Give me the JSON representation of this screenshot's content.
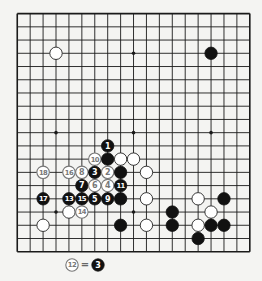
{
  "diagram": {
    "type": "go-board",
    "size": 19,
    "origin_px": {
      "x": 17.25,
      "y": 13.6
    },
    "spacing_px": {
      "x": 12.92,
      "y": 13.23
    },
    "stone_radius": 6.2,
    "colors": {
      "background": "#f4f4f2",
      "line": "#1a1a1a",
      "black_stone": "#111111",
      "white_stone": "#ffffff",
      "white_stone_border": "#222222",
      "numbered_white_ink": "#777777",
      "black_number_ink": "#ffffff"
    },
    "star_points": [
      [
        3,
        3
      ],
      [
        9,
        3
      ],
      [
        15,
        3
      ],
      [
        3,
        9
      ],
      [
        9,
        9
      ],
      [
        15,
        9
      ],
      [
        3,
        15
      ],
      [
        9,
        15
      ],
      [
        15,
        15
      ]
    ],
    "stones": [
      {
        "color": "white",
        "col": 3,
        "row": 3
      },
      {
        "color": "black",
        "col": 15,
        "row": 3
      },
      {
        "color": "black",
        "col": 7,
        "row": 10,
        "label": "1"
      },
      {
        "color": "white",
        "col": 6,
        "row": 11,
        "label": "10"
      },
      {
        "color": "black",
        "col": 7,
        "row": 11
      },
      {
        "color": "white",
        "col": 8,
        "row": 11
      },
      {
        "color": "white",
        "col": 9,
        "row": 11
      },
      {
        "color": "white",
        "col": 2,
        "row": 12,
        "label": "18"
      },
      {
        "color": "white",
        "col": 4,
        "row": 12,
        "label": "16"
      },
      {
        "color": "white",
        "col": 5,
        "row": 12,
        "label": "8"
      },
      {
        "color": "black",
        "col": 6,
        "row": 12,
        "label": "3"
      },
      {
        "color": "white",
        "col": 7,
        "row": 12,
        "label": "2"
      },
      {
        "color": "black",
        "col": 8,
        "row": 12
      },
      {
        "color": "white",
        "col": 10,
        "row": 12
      },
      {
        "color": "black",
        "col": 5,
        "row": 13,
        "label": "7"
      },
      {
        "color": "white",
        "col": 6,
        "row": 13,
        "label": "6"
      },
      {
        "color": "white",
        "col": 7,
        "row": 13,
        "label": "4"
      },
      {
        "color": "black",
        "col": 8,
        "row": 13,
        "label": "11"
      },
      {
        "color": "black",
        "col": 2,
        "row": 14,
        "label": "17"
      },
      {
        "color": "black",
        "col": 4,
        "row": 14,
        "label": "13"
      },
      {
        "color": "black",
        "col": 5,
        "row": 14,
        "label": "15"
      },
      {
        "color": "black",
        "col": 6,
        "row": 14,
        "label": "5"
      },
      {
        "color": "black",
        "col": 7,
        "row": 14,
        "label": "9"
      },
      {
        "color": "black",
        "col": 8,
        "row": 14
      },
      {
        "color": "white",
        "col": 10,
        "row": 14
      },
      {
        "color": "white",
        "col": 14,
        "row": 14
      },
      {
        "color": "black",
        "col": 16,
        "row": 14
      },
      {
        "color": "white",
        "col": 4,
        "row": 15
      },
      {
        "color": "white",
        "col": 5,
        "row": 15,
        "label": "14"
      },
      {
        "color": "black",
        "col": 12,
        "row": 15
      },
      {
        "color": "white",
        "col": 15,
        "row": 15
      },
      {
        "color": "white",
        "col": 2,
        "row": 16
      },
      {
        "color": "black",
        "col": 8,
        "row": 16
      },
      {
        "color": "white",
        "col": 10,
        "row": 16
      },
      {
        "color": "black",
        "col": 12,
        "row": 16
      },
      {
        "color": "white",
        "col": 14,
        "row": 16
      },
      {
        "color": "black",
        "col": 15,
        "row": 16
      },
      {
        "color": "black",
        "col": 16,
        "row": 16
      },
      {
        "color": "black",
        "col": 14,
        "row": 17
      }
    ],
    "caption": {
      "left_stone": {
        "color": "white",
        "label": "12",
        "x": 72,
        "y": 265
      },
      "equals": "=",
      "right_stone": {
        "color": "black",
        "label": "3",
        "x": 98,
        "y": 265
      },
      "text": "12 = 3"
    }
  }
}
